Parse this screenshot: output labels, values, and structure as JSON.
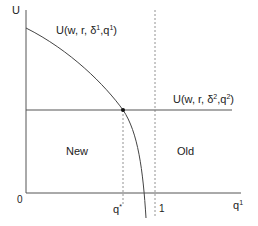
{
  "diagram": {
    "axes": {
      "y_label": "U",
      "x_label_base": "q",
      "x_label_sup": "1",
      "origin_label": "0"
    },
    "curves": {
      "curve1": {
        "label_base": "U(w, r, δ",
        "label_sup1": "1",
        "label_mid": ",q",
        "label_sup2": "1",
        "label_end": ")"
      },
      "curve2": {
        "label_base": "U(w, r, δ",
        "label_sup1": "2",
        "label_mid": ",q",
        "label_sup2": "2",
        "label_end": ")"
      }
    },
    "ticks": {
      "qstar_base": "q",
      "qstar_sup": "*",
      "one": "1"
    },
    "regions": {
      "left": "New",
      "right": "Old"
    },
    "colors": {
      "line": "#555555",
      "curve": "#444444",
      "dot": "#111111",
      "dotted": "#777777"
    }
  }
}
